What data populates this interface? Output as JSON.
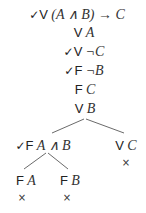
{
  "tree": {
    "trunk": [
      {
        "check": "✓",
        "value": "V",
        "formula": "(A ∧ B) → C"
      },
      {
        "check": "",
        "value": "V",
        "formula": "A"
      },
      {
        "check": "✓",
        "value": "V",
        "formula": "¬C"
      },
      {
        "check": "✓",
        "value": "F",
        "formula": "¬B"
      },
      {
        "check": "",
        "value": "F",
        "formula": "C"
      },
      {
        "check": "",
        "value": "V",
        "formula": "B"
      }
    ],
    "branch_left": {
      "check": "✓",
      "value": "F",
      "formula": "A ∧ B"
    },
    "branch_right": {
      "check": "",
      "value": "V",
      "formula": "C",
      "closed": "×"
    },
    "leaf_left": {
      "value": "F",
      "formula": "A",
      "closed": "×"
    },
    "leaf_right": {
      "value": "F",
      "formula": "B",
      "closed": "×"
    }
  }
}
